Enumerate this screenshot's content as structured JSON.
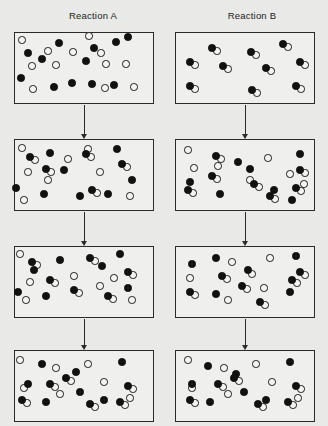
{
  "figure": {
    "type": "particulate-reaction-diagram",
    "columns": [
      {
        "id": "A",
        "title": "Reaction A",
        "title_x": 93,
        "title_y": 10
      },
      {
        "id": "B",
        "title": "Reaction B",
        "title_x": 252,
        "title_y": 10
      }
    ],
    "species": {
      "black": {
        "name": "black-atom",
        "color": "#111111"
      },
      "white": {
        "name": "white-atom",
        "color": "#f4f4f2"
      },
      "pair": {
        "name": "black-white-molecule"
      }
    },
    "panel_geometry": {
      "width": 140,
      "height": 72,
      "left_x": 14,
      "right_x": 175,
      "rows_y": [
        32,
        139,
        246,
        350
      ]
    },
    "particle_size": {
      "diameter": 7.5,
      "pair_offset_x": 5,
      "pair_offset_y": 3
    }
  },
  "chart_data": {
    "type": "scatter",
    "xlabel": "",
    "ylabel": "",
    "series": [
      {
        "name": "Reaction A - step 1",
        "panel": "A1",
        "counts": {
          "black": 12,
          "white": 12,
          "pairs": 0
        },
        "singles_black": [
          [
            24,
            49
          ],
          [
            55,
            39
          ],
          [
            90,
            44
          ],
          [
            124,
            33
          ],
          [
            17,
            74
          ],
          [
            50,
            83
          ],
          [
            68,
            79
          ],
          [
            88,
            80
          ],
          [
            112,
            38
          ],
          [
            82,
            57
          ],
          [
            110,
            81
          ],
          [
            38,
            55
          ]
        ],
        "singles_white": [
          [
            18,
            36
          ],
          [
            85,
            32
          ],
          [
            69,
            48
          ],
          [
            28,
            62
          ],
          [
            52,
            61
          ],
          [
            102,
            60
          ],
          [
            122,
            60
          ],
          [
            29,
            85
          ],
          [
            101,
            84
          ],
          [
            130,
            83
          ],
          [
            44,
            47
          ],
          [
            97,
            49
          ]
        ],
        "pairs": []
      },
      {
        "name": "Reaction A - step 2",
        "panel": "A2",
        "counts": {
          "black": 8,
          "white": 8,
          "pairs": 5
        },
        "singles_black": [
          [
            46,
            149
          ],
          [
            113,
            145
          ],
          [
            12,
            184
          ],
          [
            40,
            190
          ],
          [
            76,
            192
          ],
          [
            104,
            190
          ],
          [
            60,
            166
          ],
          [
            128,
            176
          ]
        ],
        "singles_white": [
          [
            18,
            144
          ],
          [
            64,
            155
          ],
          [
            96,
            168
          ],
          [
            24,
            168
          ],
          [
            20,
            196
          ],
          [
            126,
            192
          ],
          [
            84,
            145
          ],
          [
            44,
            176
          ]
        ],
        "pairs": [
          [
            26,
            153
          ],
          [
            82,
            150
          ],
          [
            118,
            160
          ],
          [
            42,
            165
          ],
          [
            88,
            186
          ]
        ]
      },
      {
        "name": "Reaction A - step 3",
        "panel": "A3",
        "counts": {
          "black": 7,
          "white": 7,
          "pairs": 6
        },
        "singles_black": [
          [
            56,
            256
          ],
          [
            116,
            250
          ],
          [
            14,
            288
          ],
          [
            42,
            292
          ],
          [
            124,
            284
          ],
          [
            30,
            266
          ],
          [
            98,
            262
          ]
        ],
        "singles_white": [
          [
            16,
            250
          ],
          [
            26,
            278
          ],
          [
            96,
            282
          ],
          [
            22,
            296
          ],
          [
            128,
            296
          ],
          [
            70,
            272
          ],
          [
            110,
            274
          ]
        ],
        "pairs": [
          [
            28,
            258
          ],
          [
            86,
            254
          ],
          [
            46,
            276
          ],
          [
            70,
            286
          ],
          [
            124,
            268
          ],
          [
            104,
            292
          ]
        ]
      },
      {
        "name": "Reaction A - step 4",
        "panel": "A4",
        "counts": {
          "black": 7,
          "white": 7,
          "pairs": 6
        },
        "singles_black": [
          [
            38,
            360
          ],
          [
            72,
            368
          ],
          [
            118,
            358
          ],
          [
            76,
            388
          ],
          [
            42,
            398
          ],
          [
            24,
            380
          ],
          [
            100,
            396
          ]
        ],
        "singles_white": [
          [
            16,
            356
          ],
          [
            52,
            364
          ],
          [
            84,
            360
          ],
          [
            20,
            384
          ],
          [
            100,
            378
          ],
          [
            56,
            390
          ],
          [
            126,
            394
          ]
        ],
        "pairs": [
          [
            46,
            380
          ],
          [
            124,
            382
          ],
          [
            18,
            396
          ],
          [
            86,
            400
          ],
          [
            62,
            374
          ],
          [
            116,
            398
          ]
        ]
      },
      {
        "name": "Reaction B - step 1",
        "panel": "B1",
        "counts": {
          "black": 0,
          "white": 0,
          "pairs": 10
        },
        "singles_black": [],
        "singles_white": [],
        "pairs": [
          [
            208,
            44
          ],
          [
            247,
            48
          ],
          [
            279,
            40
          ],
          [
            186,
            58
          ],
          [
            219,
            62
          ],
          [
            262,
            64
          ],
          [
            296,
            58
          ],
          [
            186,
            82
          ],
          [
            248,
            86
          ],
          [
            292,
            82
          ]
        ]
      },
      {
        "name": "Reaction B - step 2",
        "panel": "B2",
        "counts": {
          "black": 5,
          "white": 5,
          "pairs": 7
        },
        "singles_black": [
          [
            246,
            165
          ],
          [
            296,
            150
          ],
          [
            216,
            190
          ],
          [
            186,
            178
          ],
          [
            270,
            186
          ],
          [
            234,
            158
          ],
          [
            288,
            196
          ]
        ],
        "singles_white": [
          [
            184,
            146
          ],
          [
            264,
            154
          ],
          [
            246,
            176
          ],
          [
            190,
            164
          ],
          [
            286,
            170
          ],
          [
            214,
            162
          ],
          [
            300,
            180
          ]
        ],
        "pairs": [
          [
            212,
            152
          ],
          [
            208,
            172
          ],
          [
            250,
            180
          ],
          [
            296,
            166
          ],
          [
            184,
            186
          ],
          [
            266,
            192
          ],
          [
            292,
            184
          ]
        ]
      },
      {
        "name": "Reaction B - step 3",
        "panel": "B3",
        "counts": {
          "black": 6,
          "white": 6,
          "pairs": 6
        },
        "singles_black": [
          [
            212,
            254
          ],
          [
            244,
            266
          ],
          [
            188,
            260
          ],
          [
            292,
            252
          ],
          [
            286,
            288
          ],
          [
            212,
            290
          ]
        ],
        "singles_white": [
          [
            228,
            258
          ],
          [
            266,
            254
          ],
          [
            186,
            274
          ],
          [
            248,
            270
          ],
          [
            260,
            284
          ],
          [
            224,
            296
          ]
        ],
        "pairs": [
          [
            218,
            272
          ],
          [
            238,
            282
          ],
          [
            296,
            268
          ],
          [
            186,
            288
          ],
          [
            256,
            298
          ],
          [
            288,
            276
          ]
        ]
      },
      {
        "name": "Reaction B - step 4",
        "panel": "B4",
        "counts": {
          "black": 7,
          "white": 7,
          "pairs": 6
        },
        "singles_black": [
          [
            204,
            362
          ],
          [
            232,
            370
          ],
          [
            286,
            358
          ],
          [
            240,
            388
          ],
          [
            206,
            398
          ],
          [
            188,
            380
          ],
          [
            262,
            396
          ]
        ],
        "singles_white": [
          [
            184,
            356
          ],
          [
            220,
            364
          ],
          [
            252,
            360
          ],
          [
            188,
            384
          ],
          [
            268,
            378
          ],
          [
            224,
            390
          ],
          [
            294,
            394
          ]
        ],
        "pairs": [
          [
            214,
            380
          ],
          [
            292,
            382
          ],
          [
            186,
            396
          ],
          [
            254,
            400
          ],
          [
            230,
            374
          ],
          [
            284,
            398
          ]
        ]
      }
    ],
    "arrows": [
      {
        "x": 84,
        "y": 105,
        "length": 33
      },
      {
        "x": 84,
        "y": 212,
        "length": 33
      },
      {
        "x": 84,
        "y": 319,
        "length": 30
      },
      {
        "x": 245,
        "y": 105,
        "length": 33
      },
      {
        "x": 245,
        "y": 212,
        "length": 33
      },
      {
        "x": 245,
        "y": 319,
        "length": 30
      }
    ]
  }
}
